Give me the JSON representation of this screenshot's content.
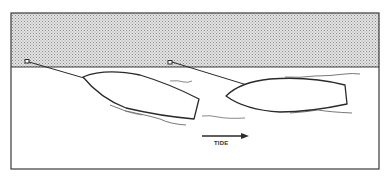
{
  "diagram": {
    "tide_label": "TIDE",
    "colors": {
      "ink": "#2a2a2a",
      "shore_fill": "#c9c9c9",
      "water_fill": "#ffffff",
      "frame": "#3a3a3a"
    },
    "elements": {
      "shore": "stippled land area along top",
      "water": "open water area",
      "boat_left": "left boat tethered to shore post",
      "boat_right": "right boat tethered to shore post",
      "tide_arrow": "arrow pointing right indicating tide direction"
    }
  }
}
